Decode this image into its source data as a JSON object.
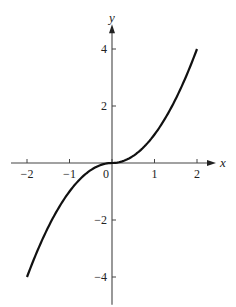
{
  "chart_data": {
    "type": "line",
    "title": "",
    "xlabel": "x",
    "ylabel": "y",
    "xlim": [
      -2.4,
      2.4
    ],
    "ylim": [
      -4.8,
      4.8
    ],
    "x_ticks": [
      -2,
      -1,
      0,
      1,
      2
    ],
    "x_tick_labels": [
      "−2",
      "−1",
      "0",
      "1",
      "2"
    ],
    "y_ticks": [
      -4,
      -2,
      2,
      4
    ],
    "y_tick_labels": [
      "−4",
      "−2",
      "2",
      "4"
    ],
    "grid": false,
    "legend": null,
    "series": [
      {
        "name": "y = x|x|",
        "color": "#111111",
        "x": [
          -2,
          -1.5,
          -1,
          -0.5,
          0,
          0.5,
          1,
          1.5,
          2
        ],
        "y": [
          -4,
          -2.25,
          -1,
          -0.25,
          0,
          0.25,
          1,
          2.25,
          4
        ]
      }
    ]
  },
  "layout": {
    "origin_px": [
      112,
      163
    ],
    "px_per_x": 42.5,
    "px_per_y": 28.5
  }
}
